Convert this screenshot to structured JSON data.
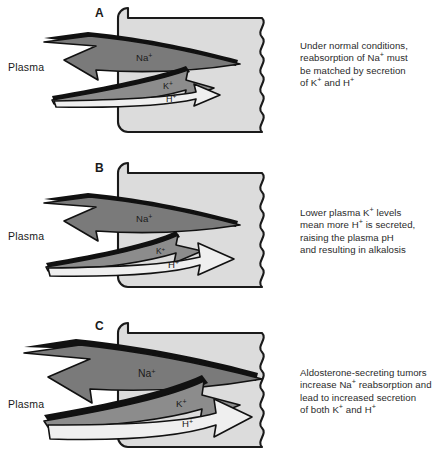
{
  "figure": {
    "colors": {
      "cell_fill": "#dcdcdc",
      "cell_stroke": "#1a1a1a",
      "arrow_dark_gray": "#7a7a7a",
      "arrow_mid_gray": "#8c8c8c",
      "arrow_white": "#efefef",
      "shadow": "#111111",
      "text": "#1a1a1a",
      "background": "#ffffff"
    }
  },
  "panels": [
    {
      "letter": "A",
      "plasma_label": "Plasma",
      "caption_lines": [
        "Under normal conditions,",
        "reabsorption of Na+ must",
        "be matched by secretion",
        "of K+ and H+"
      ],
      "arrows": [
        {
          "ion": "Na",
          "charge": "+",
          "label": "Na+",
          "direction": "left",
          "meaning": "reabsorption-into-plasma",
          "size": "medium",
          "fill": "dark-gray"
        },
        {
          "ion": "K",
          "charge": "+",
          "label": "K+",
          "direction": "right",
          "meaning": "secretion-into-lumen",
          "size": "medium",
          "fill": "mid-gray"
        },
        {
          "ion": "H",
          "charge": "+",
          "label": "H+",
          "direction": "right",
          "meaning": "secretion-into-lumen",
          "size": "medium",
          "fill": "white"
        }
      ]
    },
    {
      "letter": "B",
      "plasma_label": "Plasma",
      "caption_lines": [
        "Lower plasma K+ levels",
        "mean more H+ is secreted,",
        "raising the plasma pH",
        "and resulting in alkalosis"
      ],
      "arrows": [
        {
          "ion": "Na",
          "charge": "+",
          "label": "Na+",
          "direction": "left",
          "meaning": "reabsorption-into-plasma",
          "size": "medium",
          "fill": "dark-gray"
        },
        {
          "ion": "K",
          "charge": "+",
          "label": "K+",
          "direction": "right",
          "meaning": "secretion-into-lumen",
          "size": "small",
          "fill": "mid-gray"
        },
        {
          "ion": "H",
          "charge": "+",
          "label": "H+",
          "direction": "right",
          "meaning": "secretion-into-lumen",
          "size": "large",
          "fill": "white"
        }
      ]
    },
    {
      "letter": "C",
      "plasma_label": "Plasma",
      "caption_lines": [
        "Aldosterone-secreting tumors",
        "increase Na+ reabsorption and",
        "lead to increased secretion",
        "of both K+ and H+"
      ],
      "arrows": [
        {
          "ion": "Na",
          "charge": "+",
          "label": "Na+",
          "direction": "left",
          "meaning": "reabsorption-into-plasma",
          "size": "large",
          "fill": "dark-gray"
        },
        {
          "ion": "K",
          "charge": "+",
          "label": "K+",
          "direction": "right",
          "meaning": "secretion-into-lumen",
          "size": "large",
          "fill": "mid-gray"
        },
        {
          "ion": "H",
          "charge": "+",
          "label": "H+",
          "direction": "right",
          "meaning": "secretion-into-lumen",
          "size": "large",
          "fill": "white"
        }
      ]
    }
  ]
}
